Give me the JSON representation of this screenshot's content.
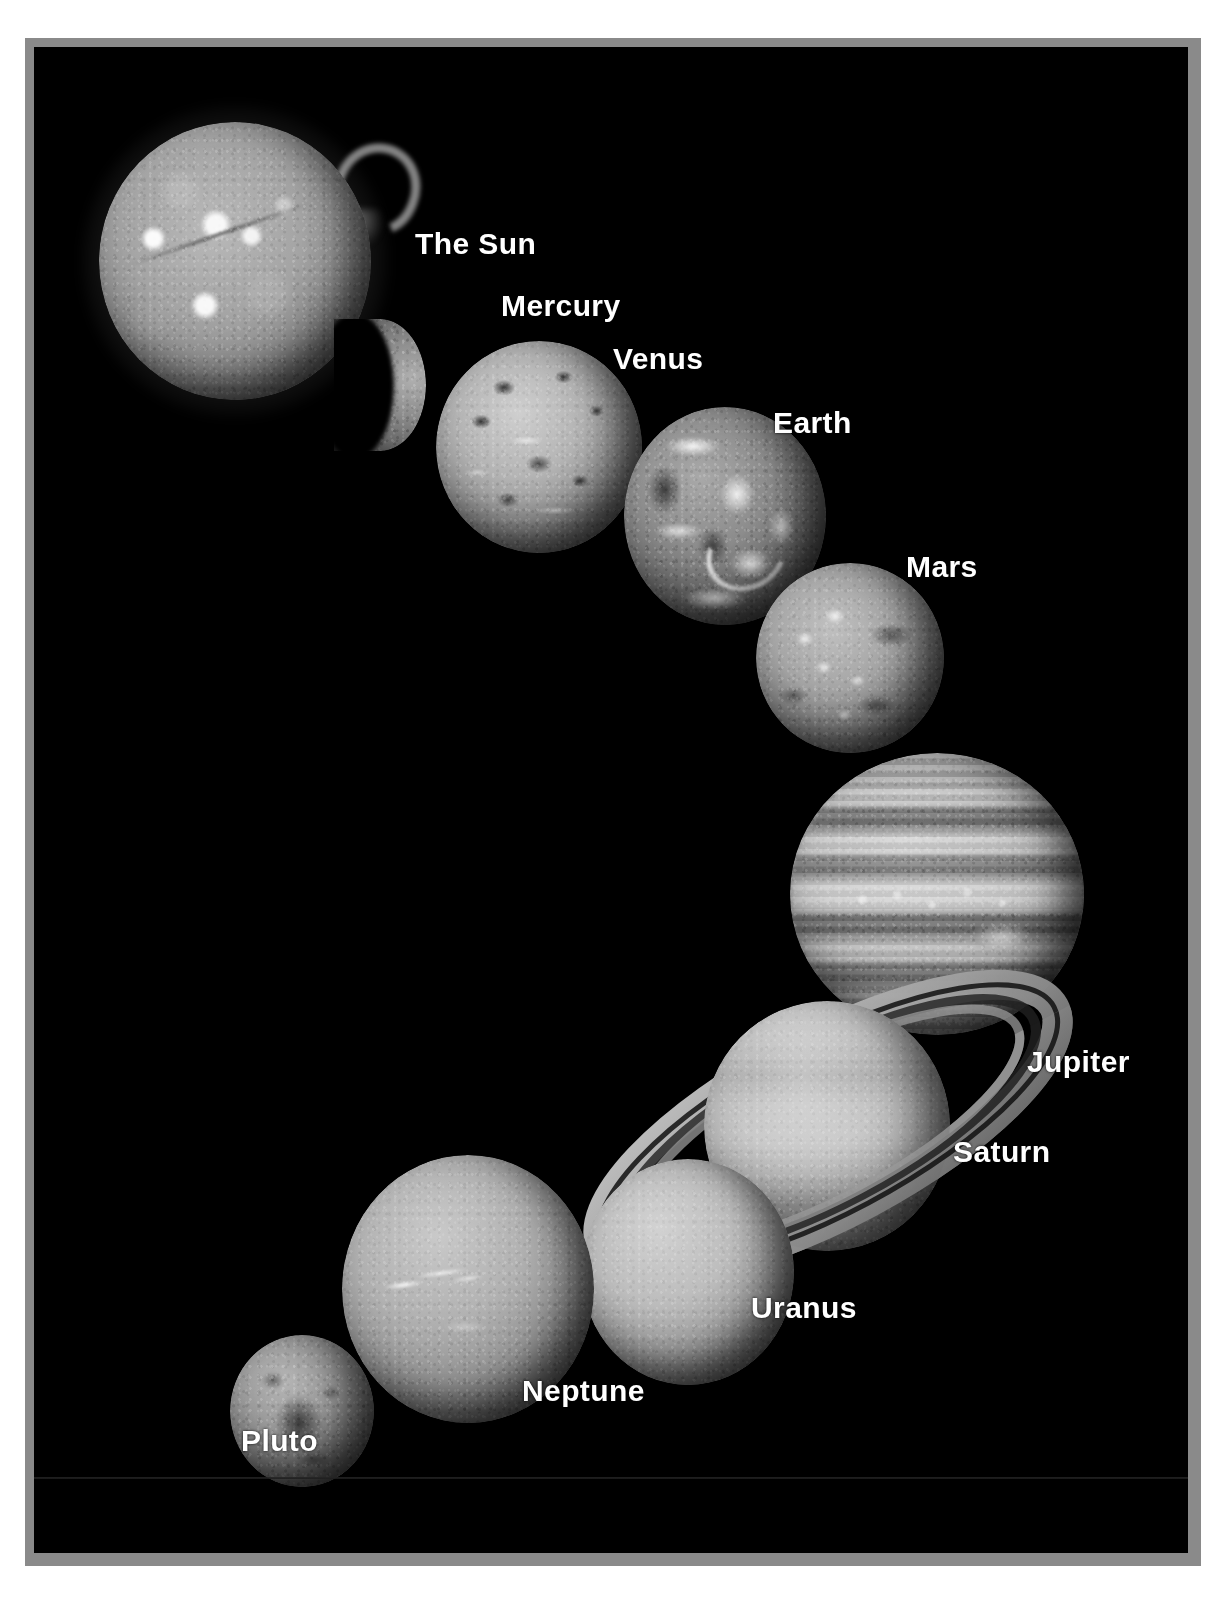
{
  "poster": {
    "title_visible": false,
    "background_color": "#000000",
    "frame_color": "#8a8a8a",
    "page_color": "#ffffff",
    "label_color": "#ffffff"
  },
  "labels": {
    "sun": "The Sun",
    "mercury": "Mercury",
    "venus": "Venus",
    "earth": "Earth",
    "mars": "Mars",
    "jupiter": "Jupiter",
    "saturn": "Saturn",
    "uranus": "Uranus",
    "neptune": "Neptune",
    "pluto": "Pluto"
  },
  "bodies": [
    {
      "name": "The Sun",
      "icon": "sun-disc-icon",
      "order": 1,
      "feature": "solar prominence loop at upper right, bright active regions"
    },
    {
      "name": "Mercury",
      "icon": "mercury-crescent-icon",
      "order": 2,
      "feature": "crescent phase, cratered limb"
    },
    {
      "name": "Venus",
      "icon": "venus-disc-icon",
      "order": 3,
      "feature": "radar-mapped surface, bright highland streaks"
    },
    {
      "name": "Earth",
      "icon": "earth-disc-icon",
      "order": 4,
      "feature": "cloud swirls over continents"
    },
    {
      "name": "Mars",
      "icon": "mars-disc-icon",
      "order": 5,
      "feature": "bright polar and volcanic highlands, dark maria"
    },
    {
      "name": "Jupiter",
      "icon": "jupiter-disc-icon",
      "order": 6,
      "feature": "banded cloud belts and Great Red Spot"
    },
    {
      "name": "Saturn",
      "icon": "saturn-ringed-icon",
      "order": 7,
      "feature": "tilted ring system with Cassini division"
    },
    {
      "name": "Uranus",
      "icon": "uranus-disc-icon",
      "order": 8,
      "feature": "featureless pale disc"
    },
    {
      "name": "Neptune",
      "icon": "neptune-disc-icon",
      "order": 9,
      "feature": "bright cirrus cloud streaks"
    },
    {
      "name": "Pluto",
      "icon": "pluto-disc-icon",
      "order": 10,
      "feature": "mottled small disc with dark blotch"
    }
  ]
}
